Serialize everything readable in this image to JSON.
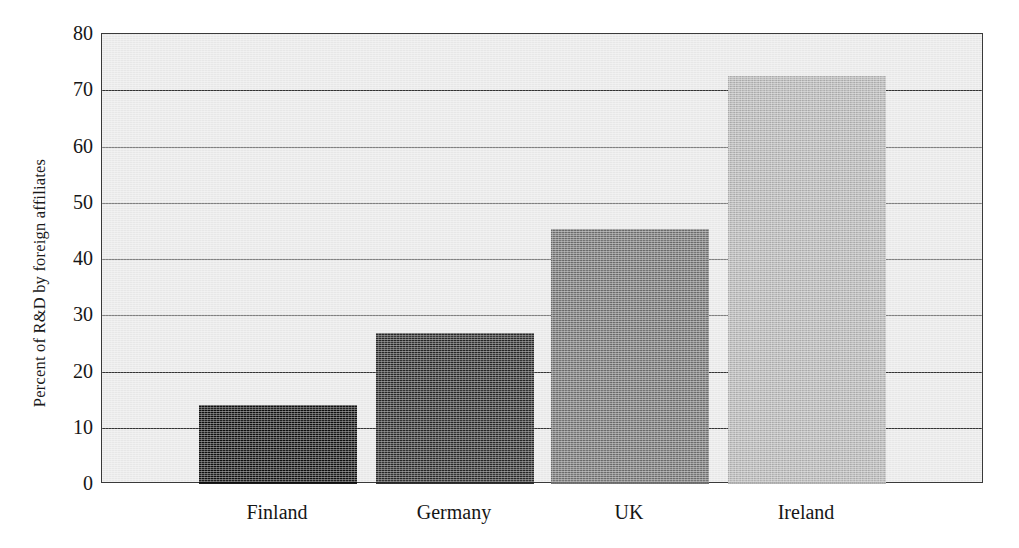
{
  "chart_data": {
    "type": "bar",
    "title": "",
    "xlabel": "",
    "ylabel": "Percent of R&D by foreign affiliates",
    "categories": [
      "Finland",
      "Germany",
      "UK",
      "Ireland"
    ],
    "values": [
      14.0,
      26.8,
      45.3,
      72.5
    ],
    "ylim": [
      0,
      80
    ],
    "yticks": [
      0,
      10,
      20,
      30,
      40,
      50,
      60,
      70,
      80
    ],
    "ytick_labels": [
      "0",
      "10",
      "20",
      "30",
      "40",
      "50",
      "60",
      "70",
      "80"
    ],
    "grid": true,
    "grid_axis": "y",
    "legend": false,
    "bar_colors": [
      "#0d0d0d",
      "#262626",
      "#6e6e6e",
      "#b4b4b4"
    ],
    "plot_background": "#e7e7e7",
    "axis_color": "#333333",
    "series": [
      {
        "name": "Percent of R&D by foreign affiliates",
        "points": [
          {
            "category": "Finland",
            "value": 14.0
          },
          {
            "category": "Germany",
            "value": 26.8
          },
          {
            "category": "UK",
            "value": 45.3
          },
          {
            "category": "Ireland",
            "value": 72.5
          }
        ]
      }
    ]
  }
}
